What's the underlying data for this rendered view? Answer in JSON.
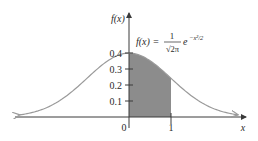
{
  "chart_data": {
    "type": "line",
    "title": "",
    "function_label": {
      "lhs": "f(x) =",
      "numerator": "1",
      "denominator": "√2π",
      "exp_base": "e",
      "exponent": "−x²/2"
    },
    "xlabel": "x",
    "ylabel": "f(x)",
    "x_ticks": [
      "0",
      "1"
    ],
    "y_ticks": [
      "0.1",
      "0.2",
      "0.3",
      "0.4"
    ],
    "xlim": [
      -3,
      3
    ],
    "ylim": [
      0,
      0.45
    ],
    "grid": false,
    "series": [
      {
        "name": "standard normal density",
        "x": [
          -2.6,
          -2,
          -1.5,
          -1,
          -0.5,
          0,
          0.5,
          1,
          1.5,
          2,
          2.6
        ],
        "values": [
          0.014,
          0.054,
          0.13,
          0.242,
          0.352,
          0.399,
          0.352,
          0.242,
          0.13,
          0.054,
          0.014
        ]
      }
    ],
    "shaded_region": {
      "x_from": 0,
      "x_to": 1,
      "area": 0.3413
    },
    "colors": {
      "curve": "#9a9a9a",
      "shade": "#8c8c8c",
      "axis": "#3a3a3a"
    }
  }
}
